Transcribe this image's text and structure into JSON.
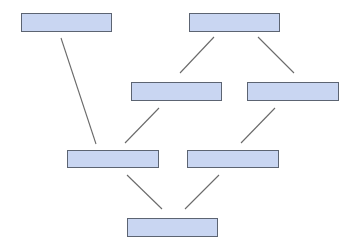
{
  "diagram": {
    "type": "hierarchy",
    "colors": {
      "node_fill": "#c9d6f2",
      "node_border": "#5c6472",
      "edge": "#6a6a6a",
      "background": "#ffffff"
    },
    "nodes": [
      {
        "id": "n1",
        "label": "",
        "x": 21,
        "y": 13,
        "w": 91,
        "h": 19
      },
      {
        "id": "n2",
        "label": "",
        "x": 189,
        "y": 13,
        "w": 91,
        "h": 19
      },
      {
        "id": "n3",
        "label": "",
        "x": 131,
        "y": 82,
        "w": 91,
        "h": 19
      },
      {
        "id": "n4",
        "label": "",
        "x": 247,
        "y": 82,
        "w": 92,
        "h": 19
      },
      {
        "id": "n5",
        "label": "",
        "x": 67,
        "y": 150,
        "w": 92,
        "h": 18
      },
      {
        "id": "n6",
        "label": "",
        "x": 187,
        "y": 150,
        "w": 92,
        "h": 18
      },
      {
        "id": "n7",
        "label": "",
        "x": 127,
        "y": 218,
        "w": 91,
        "h": 19
      }
    ],
    "edges": [
      {
        "from": "n1",
        "to": "n5",
        "x1": 61,
        "y1": 38,
        "x2": 96,
        "y2": 144
      },
      {
        "from": "n2",
        "to": "n3",
        "x1": 214,
        "y1": 37,
        "x2": 180,
        "y2": 73
      },
      {
        "from": "n2",
        "to": "n4",
        "x1": 258,
        "y1": 37,
        "x2": 294,
        "y2": 73
      },
      {
        "from": "n3",
        "to": "n5",
        "x1": 159,
        "y1": 108,
        "x2": 125,
        "y2": 143
      },
      {
        "from": "n4",
        "to": "n6",
        "x1": 275,
        "y1": 108,
        "x2": 241,
        "y2": 143
      },
      {
        "from": "n5",
        "to": "n7",
        "x1": 127,
        "y1": 175,
        "x2": 162,
        "y2": 209
      },
      {
        "from": "n6",
        "to": "n7",
        "x1": 219,
        "y1": 175,
        "x2": 185,
        "y2": 209
      }
    ]
  }
}
